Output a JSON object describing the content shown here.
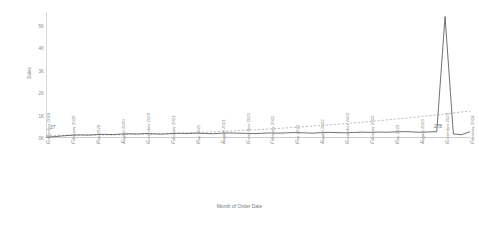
{
  "chart_data": {
    "type": "line",
    "title": "",
    "xlabel": "Month of Order Date",
    "ylabel": "Sales",
    "ylim": [
      0,
      5600
    ],
    "grid": false,
    "legend": "none",
    "y_ticks": [
      {
        "label": "5K",
        "value": 5000
      },
      {
        "label": "4K",
        "value": 4000
      },
      {
        "label": "3K",
        "value": 3000
      },
      {
        "label": "2K",
        "value": 2000
      },
      {
        "label": "1K",
        "value": 1000
      },
      {
        "label": "0K",
        "value": 0
      }
    ],
    "x_tick_labels": [
      "November 2019",
      "February 2020",
      "May 2020",
      "August 2020",
      "November 2020",
      "February 2021",
      "May 2021",
      "August 2021",
      "November 2021",
      "February 2022",
      "May 2022",
      "August 2022",
      "November 2022",
      "February 2023",
      "May 2023",
      "August 2023",
      "November 2023",
      "February 2024"
    ],
    "annotations": [
      {
        "name": "first-point-label",
        "text": "37",
        "value": 37
      },
      {
        "name": "last-point-label",
        "text": "278",
        "value": 278
      }
    ],
    "series": [
      {
        "name": "Sales",
        "style": "solid",
        "color": "#4a4a4a",
        "categories": [
          "November 2019",
          "December 2019",
          "January 2020",
          "February 2020",
          "March 2020",
          "April 2020",
          "May 2020",
          "June 2020",
          "July 2020",
          "August 2020",
          "September 2020",
          "October 2020",
          "November 2020",
          "December 2020",
          "January 2021",
          "February 2021",
          "March 2021",
          "April 2021",
          "May 2021",
          "June 2021",
          "July 2021",
          "August 2021",
          "September 2021",
          "October 2021",
          "November 2021",
          "December 2021",
          "January 2022",
          "February 2022",
          "March 2022",
          "April 2022",
          "May 2022",
          "June 2022",
          "July 2022",
          "August 2022",
          "September 2022",
          "October 2022",
          "November 2022",
          "December 2022",
          "January 2023",
          "February 2023",
          "March 2023",
          "April 2023",
          "May 2023",
          "June 2023",
          "July 2023",
          "August 2023",
          "September 2023",
          "October 2023",
          "November 2023",
          "December 2023",
          "January 2024",
          "February 2024"
        ],
        "values": [
          37,
          60,
          95,
          120,
          140,
          130,
          150,
          165,
          150,
          175,
          190,
          180,
          200,
          185,
          170,
          195,
          210,
          200,
          215,
          205,
          190,
          210,
          225,
          215,
          205,
          195,
          210,
          225,
          215,
          230,
          245,
          230,
          215,
          235,
          250,
          240,
          230,
          245,
          260,
          250,
          265,
          255,
          270,
          285,
          270,
          255,
          270,
          280,
          5400,
          175,
          150,
          278
        ]
      },
      {
        "name": "Trend",
        "style": "dashed",
        "color": "#9a9a9a",
        "categories": [
          "November 2019",
          "February 2024"
        ],
        "values": [
          120,
          1200
        ],
        "note": "gently rising dashed trend line"
      }
    ]
  }
}
